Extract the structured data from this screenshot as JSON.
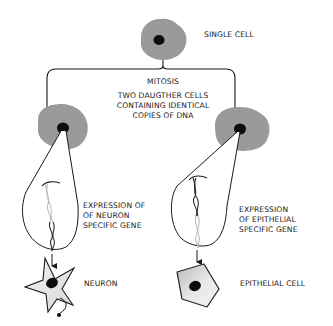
{
  "diagram": {
    "colors": {
      "cell_fill": "#9a9a9a",
      "nucleus": "#0d0d0d",
      "line": "#1a1a1a",
      "dna_dark": "#2a2a2a",
      "dna_light": "#bdbdbd",
      "differentiated_fill": "#e4e4e4"
    },
    "labels": {
      "single_cell": "SINGLE CELL",
      "mitosis": "MITOSIS",
      "daughter_line1": "TWO DAUGTHER CELLS",
      "daughter_line2": "CONTAINING IDENTICAL",
      "daughter_line3": "COPIES OF DNA",
      "neuron_expr_line1": "EXPRESSION OF",
      "neuron_expr_line2": "OF NEURON",
      "neuron_expr_line3": "SPECIFIC GENE",
      "epi_expr_line1": "EXPRESSION",
      "epi_expr_line2": "OF EPITHELIAL",
      "epi_expr_line3": "SPECIFIC GENE",
      "neuron": "NEURON",
      "epithelial_cell": "EPITHELIAL CELL"
    },
    "nodes": [
      {
        "id": "single-cell",
        "label": "SINGLE CELL"
      },
      {
        "id": "daughter-cell-left",
        "label": "Daughter cell"
      },
      {
        "id": "daughter-cell-right",
        "label": "Daughter cell"
      },
      {
        "id": "neuron",
        "label": "NEURON"
      },
      {
        "id": "epithelial-cell",
        "label": "EPITHELIAL CELL"
      }
    ],
    "edges": [
      {
        "from": "single-cell",
        "to": "daughter-cell-left",
        "label": "MITOSIS"
      },
      {
        "from": "single-cell",
        "to": "daughter-cell-right",
        "label": "MITOSIS"
      },
      {
        "from": "daughter-cell-left",
        "to": "neuron",
        "label": "EXPRESSION OF OF NEURON SPECIFIC GENE"
      },
      {
        "from": "daughter-cell-right",
        "to": "epithelial-cell",
        "label": "EXPRESSION OF EPITHELIAL SPECIFIC GENE"
      }
    ]
  }
}
